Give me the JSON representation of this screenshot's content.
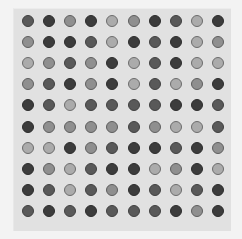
{
  "grid": {
    "rows": 10,
    "cols": 10,
    "legend_shades": {
      "L": "#ababab",
      "LM": "#8f8f8f",
      "DM": "#595959",
      "D": "#3c3c3c"
    },
    "cells": [
      [
        "DM",
        "D",
        "LM",
        "D",
        "L",
        "LM",
        "D",
        "DM",
        "L",
        "D"
      ],
      [
        "LM",
        "D",
        "D",
        "DM",
        "L",
        "D",
        "DM",
        "D",
        "L",
        "LM"
      ],
      [
        "L",
        "LM",
        "DM",
        "LM",
        "D",
        "L",
        "DM",
        "D",
        "L",
        "L"
      ],
      [
        "LM",
        "DM",
        "D",
        "LM",
        "D",
        "L",
        "DM",
        "L",
        "LM",
        "D"
      ],
      [
        "D",
        "DM",
        "L",
        "DM",
        "DM",
        "DM",
        "DM",
        "D",
        "D",
        "DM"
      ],
      [
        "D",
        "LM",
        "LM",
        "LM",
        "LM",
        "DM",
        "LM",
        "L",
        "L",
        "DM"
      ],
      [
        "L",
        "L",
        "D",
        "LM",
        "DM",
        "D",
        "D",
        "DM",
        "D",
        "LM"
      ],
      [
        "D",
        "LM",
        "L",
        "DM",
        "D",
        "D",
        "L",
        "LM",
        "D",
        "L"
      ],
      [
        "D",
        "DM",
        "L",
        "DM",
        "LM",
        "D",
        "DM",
        "L",
        "DM",
        "D"
      ],
      [
        "DM",
        "D",
        "DM",
        "D",
        "DM",
        "DM",
        "DM",
        "D",
        "LM",
        "D"
      ]
    ]
  }
}
